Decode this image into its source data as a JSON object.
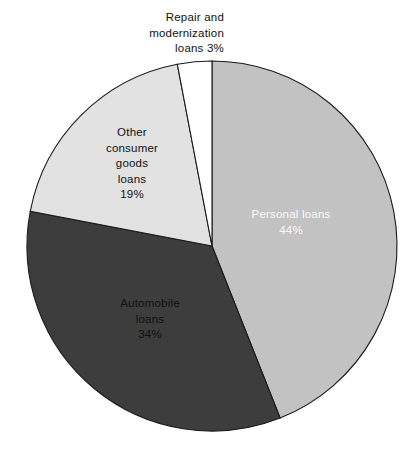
{
  "chart_data": {
    "type": "pie",
    "title": "",
    "subtitle": "",
    "xlabel": "",
    "ylabel": "",
    "legend_position": "none",
    "grid": false,
    "units": "percent",
    "start_angle_deg": 0,
    "direction": "clockwise",
    "categories": [
      "Personal loans",
      "Automobile loans",
      "Other consumer goods loans",
      "Repair and modernization loans"
    ],
    "values": [
      44,
      34,
      19,
      3
    ],
    "total": 100,
    "slices": [
      {
        "name": "personal-loans",
        "label_lines": [
          "Personal  loans",
          "44%"
        ],
        "value": 44,
        "value_label": "44%",
        "color": "#c2c2c2",
        "text_color": "#fbfbfb",
        "start_deg": 0,
        "end_deg": 158.4,
        "label_x": 291,
        "label_y": 218,
        "label_placement": "inside"
      },
      {
        "name": "automobile-loans",
        "label_lines": [
          "Automobile",
          "loans",
          "34%"
        ],
        "value": 34,
        "value_label": "34%",
        "color": "#3d3d3d",
        "text_color": "#111111",
        "start_deg": 158.4,
        "end_deg": 280.8,
        "label_x": 150,
        "label_y": 307,
        "label_placement": "inside"
      },
      {
        "name": "other-consumer-goods-loans",
        "label_lines": [
          "Other",
          "consumer",
          "goods",
          "loans",
          "19%"
        ],
        "value": 19,
        "value_label": "19%",
        "color": "#e2e2e2",
        "text_color": "#111111",
        "start_deg": 280.8,
        "end_deg": 349.2,
        "label_x": 132,
        "label_y": 136,
        "label_placement": "inside"
      },
      {
        "name": "repair-and-modernization-loans",
        "label_lines": [
          "Repair and",
          "modernization",
          "loans 3%"
        ],
        "value": 3,
        "value_label": "3%",
        "color": "#ffffff",
        "text_color": "#111111",
        "start_deg": 349.2,
        "end_deg": 360,
        "label_x": 224,
        "label_y": 21,
        "label_placement": "outside-top"
      }
    ],
    "geometry": {
      "center_x": 212,
      "center_y": 246,
      "radius": 185,
      "outline_color": "#1a1a1a",
      "outline_width": 1.1
    }
  }
}
